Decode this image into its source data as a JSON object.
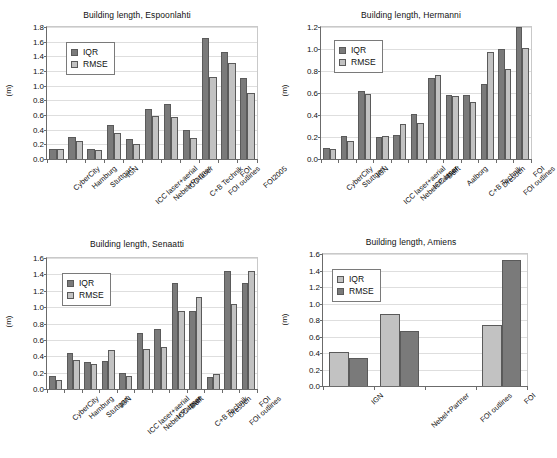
{
  "figure": {
    "ylabel": "(m)",
    "legend_iqr": "IQR",
    "legend_rmse": "RMSE"
  },
  "chart_data": [
    {
      "id": "espoonlahti",
      "type": "bar",
      "title": "Building length, Espoonlahti",
      "xlabel": "",
      "ylabel": "(m)",
      "ylim": [
        0.0,
        1.8
      ],
      "yticks": [
        "0.0",
        "0.2",
        "0.4",
        "0.6",
        "0.8",
        "1.0",
        "1.2",
        "1.4",
        "1.6",
        "1.8"
      ],
      "grid": true,
      "legend_position": "upper-left",
      "series_colors": {
        "IQR": "#7a7a7a",
        "RMSE": "#c2c2c2"
      },
      "categories": [
        "CyberCity",
        "Hamburg",
        "Stuttgart",
        "IGN",
        "ICC laser+aerial",
        "Nebel+Partner",
        "ICC laser",
        "C+B Technik",
        "FOI outlines",
        "FOI",
        "FOI2005"
      ],
      "series": [
        {
          "name": "IQR",
          "values": [
            0.13,
            0.3,
            0.13,
            0.46,
            0.27,
            0.68,
            0.75,
            0.4,
            1.65,
            1.46,
            1.1
          ]
        },
        {
          "name": "RMSE",
          "values": [
            0.13,
            0.25,
            0.12,
            0.35,
            0.21,
            0.59,
            0.57,
            0.28,
            1.12,
            1.31,
            0.9
          ]
        }
      ]
    },
    {
      "id": "hermanni",
      "type": "bar",
      "title": "Building length, Hermanni",
      "xlabel": "",
      "ylabel": "(m)",
      "ylim": [
        0.0,
        1.2
      ],
      "yticks": [
        "0.0",
        "0.2",
        "0.4",
        "0.6",
        "0.8",
        "1.0",
        "1.2"
      ],
      "grid": true,
      "legend_position": "upper-left",
      "series_colors": {
        "IQR": "#7a7a7a",
        "RMSE": "#c2c2c2"
      },
      "categories": [
        "CyberCity",
        "Stuttgart",
        "IGN",
        "ICC laser+aerial",
        "Nebel+Partner",
        "ICC laser",
        "Delft",
        "Aalborg",
        "C+B Technik",
        "Dresden",
        "FOI outlines",
        "FOI"
      ],
      "series": [
        {
          "name": "IQR",
          "values": [
            0.1,
            0.21,
            0.62,
            0.2,
            0.22,
            0.41,
            0.74,
            0.58,
            0.58,
            0.68,
            1.0,
            1.2
          ]
        },
        {
          "name": "RMSE",
          "values": [
            0.09,
            0.16,
            0.59,
            0.21,
            0.32,
            0.33,
            0.76,
            0.57,
            0.52,
            0.97,
            0.82,
            1.01
          ]
        }
      ]
    },
    {
      "id": "senaatti",
      "type": "bar",
      "title": "Building length, Senaatti",
      "xlabel": "",
      "ylabel": "(m)",
      "ylim": [
        0.0,
        1.6
      ],
      "yticks": [
        "0.0",
        "0.2",
        "0.4",
        "0.6",
        "0.8",
        "1.0",
        "1.2",
        "1.4",
        "1.6"
      ],
      "grid": true,
      "legend_position": "upper-left",
      "series_colors": {
        "IQR": "#7a7a7a",
        "RMSE": "#c2c2c2"
      },
      "categories": [
        "CyberCity",
        "Hamburg",
        "Stuttgart",
        "IGN",
        "ICC laser+aerial",
        "Nebel+Partner",
        "ICC laser",
        "Delft",
        "C+B Technik",
        "Dresden",
        "FOI outlines",
        "FOI"
      ],
      "series": [
        {
          "name": "IQR",
          "values": [
            0.16,
            0.44,
            0.33,
            0.34,
            0.19,
            0.69,
            0.73,
            1.3,
            0.95,
            0.15,
            1.44,
            1.3
          ]
        },
        {
          "name": "RMSE",
          "values": [
            0.11,
            0.36,
            0.31,
            0.48,
            0.16,
            0.49,
            0.51,
            0.95,
            1.12,
            0.18,
            1.04,
            1.44
          ]
        }
      ]
    },
    {
      "id": "amiens",
      "type": "bar",
      "title": "Building length, Amiens",
      "xlabel": "",
      "ylabel": "(m)",
      "ylim": [
        0.0,
        1.6
      ],
      "yticks": [
        "0.0",
        "0.2",
        "0.4",
        "0.6",
        "0.8",
        "1.0",
        "1.2",
        "1.4",
        "1.6"
      ],
      "grid": true,
      "legend_position": "upper-left",
      "series_colors": {
        "IQR": "#c2c2c2",
        "RMSE": "#7a7a7a"
      },
      "categories": [
        "IGN",
        "Nebel+Partner",
        "FOI outlines",
        "FOI"
      ],
      "series": [
        {
          "name": "IQR",
          "values": [
            0.41,
            0.87,
            0.0,
            0.74
          ]
        },
        {
          "name": "RMSE",
          "values": [
            0.34,
            0.67,
            0.0,
            1.53
          ]
        }
      ]
    }
  ]
}
